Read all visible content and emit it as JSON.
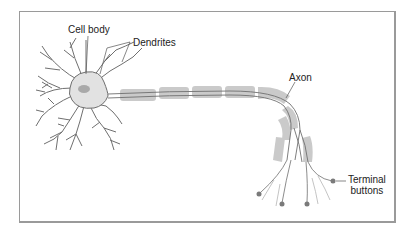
{
  "diagram": {
    "labels": {
      "cell_body": "Cell body",
      "dendrites": "Dendrites",
      "axon": "Axon",
      "terminal_line1": "Terminal",
      "terminal_line2": "buttons"
    },
    "colors": {
      "frame": "#9a9a9a",
      "outline": "#6f6f6f",
      "cell_fill": "#e2e2e2",
      "nucleus": "#a9a9a9",
      "myelin": "#c8c8c8",
      "terminal_button": "#7a7a7a",
      "text": "#222222"
    }
  }
}
